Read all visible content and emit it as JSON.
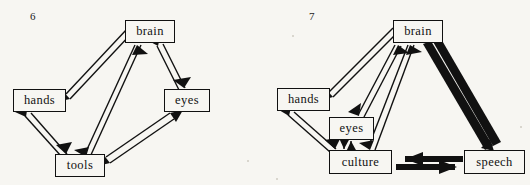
{
  "figure": {
    "background_color": "#f7f6f2",
    "ink_color": "#111111",
    "panels": [
      {
        "number": "6",
        "name": "panel-six",
        "nodes": [
          {
            "id": "brain",
            "label": "brain",
            "x": 125,
            "y": 20,
            "w": 50,
            "h": 23
          },
          {
            "id": "hands",
            "label": "hands",
            "x": 13,
            "y": 89,
            "w": 53,
            "h": 23
          },
          {
            "id": "eyes",
            "label": "eyes",
            "x": 164,
            "y": 89,
            "w": 46,
            "h": 23
          },
          {
            "id": "tools",
            "label": "tools",
            "x": 55,
            "y": 154,
            "w": 50,
            "h": 23
          }
        ],
        "edges": [
          {
            "from": "brain",
            "to": "hands",
            "style": "thin",
            "bidirectional": true
          },
          {
            "from": "brain",
            "to": "tools",
            "style": "thin",
            "bidirectional": true
          },
          {
            "from": "brain",
            "to": "eyes",
            "style": "thin",
            "bidirectional": true
          },
          {
            "from": "hands",
            "to": "tools",
            "style": "thin",
            "bidirectional": true
          },
          {
            "from": "eyes",
            "to": "tools",
            "style": "thin",
            "bidirectional": true
          }
        ]
      },
      {
        "number": "7",
        "name": "panel-seven",
        "nodes": [
          {
            "id": "brain",
            "label": "brain",
            "x": 128,
            "y": 20,
            "w": 50,
            "h": 23
          },
          {
            "id": "hands",
            "label": "hands",
            "x": 12,
            "y": 88,
            "w": 53,
            "h": 23
          },
          {
            "id": "eyes",
            "label": "eyes",
            "x": 64,
            "y": 117,
            "w": 45,
            "h": 23
          },
          {
            "id": "culture",
            "label": "culture",
            "x": 64,
            "y": 150,
            "w": 63,
            "h": 24
          },
          {
            "id": "speech",
            "label": "speech",
            "x": 199,
            "y": 150,
            "w": 61,
            "h": 24
          }
        ],
        "edges": [
          {
            "from": "brain",
            "to": "hands",
            "style": "thin",
            "bidirectional": true
          },
          {
            "from": "brain",
            "to": "eyes",
            "style": "thin",
            "bidirectional": true
          },
          {
            "from": "brain",
            "to": "culture",
            "style": "thin",
            "bidirectional": true
          },
          {
            "from": "brain",
            "to": "speech",
            "style": "thick",
            "bidirectional": true
          },
          {
            "from": "hands",
            "to": "culture",
            "style": "thin",
            "bidirectional": true
          },
          {
            "from": "eyes",
            "to": "culture",
            "style": "thin",
            "bidirectional": true
          },
          {
            "from": "culture",
            "to": "speech",
            "style": "thick",
            "bidirectional": true
          }
        ]
      }
    ]
  }
}
